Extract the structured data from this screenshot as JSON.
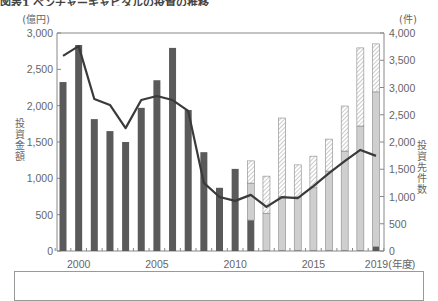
{
  "title": "図表1 ベンチャーキャピタルの投資の推移",
  "left_axis": {
    "unit": "(億円)",
    "label": "投資金額",
    "ticks": [
      "0",
      "500",
      "1,000",
      "1,500",
      "2,000",
      "2,500",
      "3,000"
    ]
  },
  "right_axis": {
    "unit": "(件)",
    "label": "投資先件数",
    "ticks": [
      "0",
      "500",
      "1,000",
      "1,500",
      "2,000",
      "2,500",
      "3,000",
      "3,500",
      "4,000"
    ]
  },
  "x_axis": {
    "tick_labels": [
      "2000",
      "2005",
      "2010",
      "2015",
      "2019(年度)"
    ]
  },
  "colors": {
    "dark_bar": "#5a5a5a",
    "light_bar": "#cfcfcf",
    "hatch": "#9a9a9a",
    "line": "#3a3a3a",
    "axis": "#888888"
  },
  "chart_data": {
    "type": "bar",
    "title": "ベンチャーキャピタルの投資の推移",
    "xlabel": "年度",
    "ylabel": "投資金額(億円)",
    "y2label": "投資先件数(件)",
    "ylim": [
      0,
      3000
    ],
    "y2lim": [
      0,
      4000
    ],
    "grid": false,
    "categories": [
      "1999",
      "2000",
      "2001",
      "2002",
      "2003",
      "2004",
      "2005",
      "2006",
      "2007",
      "2008",
      "2009",
      "2010",
      "2011",
      "2012",
      "2013",
      "2014",
      "2015",
      "2016",
      "2017",
      "2018",
      "2019"
    ],
    "series": [
      {
        "name": "投資金額(旧区分・濃色)",
        "type": "bar",
        "axis": "left",
        "values": [
          2325,
          2835,
          1815,
          1650,
          1500,
          1970,
          2350,
          2795,
          1940,
          1360,
          870,
          1130,
          425,
          10,
          10,
          10,
          10,
          10,
          10,
          10,
          60
        ]
      },
      {
        "name": "投資金額(淡色)",
        "type": "bar-stacked",
        "axis": "left",
        "values": [
          0,
          0,
          0,
          0,
          0,
          0,
          0,
          0,
          0,
          0,
          0,
          0,
          510,
          510,
          735,
          735,
          860,
          1090,
          1365,
          1710,
          2130
        ]
      },
      {
        "name": "投資金額(斜線)",
        "type": "bar-stacked",
        "axis": "left",
        "values": [
          0,
          0,
          0,
          0,
          0,
          0,
          0,
          0,
          0,
          0,
          0,
          0,
          305,
          510,
          1085,
          440,
          435,
          440,
          620,
          1075,
          660
        ]
      },
      {
        "name": "投資先件数",
        "type": "line",
        "axis": "right",
        "values": [
          3580,
          3760,
          2790,
          2680,
          2255,
          2770,
          2845,
          2770,
          2570,
          1250,
          990,
          920,
          1030,
          810,
          990,
          970,
          1190,
          1430,
          1650,
          1855,
          1745
        ]
      }
    ]
  }
}
